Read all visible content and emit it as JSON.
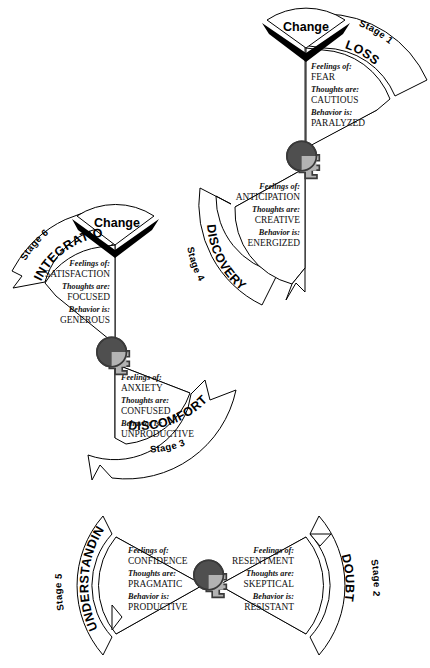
{
  "diagram": {
    "change_label": "Change",
    "attribute_keys": {
      "feelings": "Feelings of:",
      "thoughts": "Thoughts are:",
      "behavior": "Behavior is:"
    },
    "colors": {
      "outline": "#000000",
      "fill": "#ffffff",
      "chevron": "#000000",
      "head_dark": "#4f4f4f",
      "head_light": "#b3b3b3",
      "head_outline": "#3a3a3a"
    },
    "stages": [
      {
        "id": "stage-1",
        "number": "Stage 1",
        "name": "LOSS",
        "feelings": "FEAR",
        "thoughts": "CAUTIOUS",
        "behavior": "PARALYZED",
        "has_change_chevron": true,
        "text_align": "left"
      },
      {
        "id": "stage-2",
        "number": "Stage 2",
        "name": "DOUBT",
        "feelings": "RESENTMENT",
        "thoughts": "SKEPTICAL",
        "behavior": "RESISTANT",
        "has_change_chevron": false,
        "text_align": "right"
      },
      {
        "id": "stage-3",
        "number": "Stage 3",
        "name": "DISCOMFORT",
        "feelings": "ANXIETY",
        "thoughts": "CONFUSED",
        "behavior": "UNPRODUCTIVE",
        "has_change_chevron": false,
        "text_align": "left"
      },
      {
        "id": "stage-4",
        "number": "Stage 4",
        "name": "DISCOVERY",
        "feelings": "ANTICIPATION",
        "thoughts": "CREATIVE",
        "behavior": "ENERGIZED",
        "has_change_chevron": false,
        "text_align": "right"
      },
      {
        "id": "stage-5",
        "number": "Stage 5",
        "name": "UNDERSTANDING",
        "feelings": "CONFIDENCE",
        "thoughts": "PRAGMATIC",
        "behavior": "PRODUCTIVE",
        "has_change_chevron": false,
        "text_align": "left"
      },
      {
        "id": "stage-6",
        "number": "Stage 6",
        "name": "INTEGRATION",
        "feelings": "SATISFACTION",
        "thoughts": "FOCUSED",
        "behavior": "GENEROUS",
        "has_change_chevron": true,
        "text_align": "right"
      }
    ],
    "icons": {
      "head": "head-profile-icon",
      "change_chevron": "change-chevron-icon"
    }
  }
}
